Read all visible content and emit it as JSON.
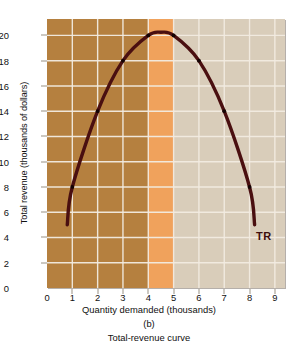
{
  "chart_data": {
    "type": "line",
    "title": "",
    "panel_label": "(b)",
    "caption": "Total-revenue curve",
    "xlabel": "Quantity demanded (thousands)",
    "ylabel": "Total revenue (thousands of dollars)",
    "xlim": [
      0,
      9.4
    ],
    "ylim": [
      0,
      21.3
    ],
    "grid": true,
    "xticks": [
      "0",
      "1",
      "2",
      "3",
      "4",
      "5",
      "6",
      "7",
      "8",
      "9"
    ],
    "xtick_values": [
      0,
      1,
      2,
      3,
      4,
      5,
      6,
      7,
      8,
      9
    ],
    "yticks": [
      "0",
      "2",
      "4",
      "6",
      "8",
      "10",
      "12",
      "14",
      "16",
      "18",
      "$20"
    ],
    "ytick_values": [
      0,
      2,
      4,
      6,
      8,
      10,
      12,
      14,
      16,
      18,
      20
    ],
    "legend": [],
    "series": [
      {
        "name": "TR",
        "label": "TR",
        "label_x": 8.25,
        "label_y": 4.6,
        "color": "#4a0f10",
        "x": [
          0.8,
          1,
          2,
          3,
          4,
          4.5,
          5,
          6,
          7,
          8,
          8.2
        ],
        "y": [
          5.0,
          8.0,
          14.0,
          18.0,
          20.0,
          20.25,
          20.0,
          18.0,
          14.0,
          8.0,
          5.0
        ],
        "markers_x": [
          1,
          2,
          3,
          4,
          5,
          6,
          7,
          8
        ],
        "markers_y": [
          8,
          14,
          18,
          20,
          20,
          18,
          14,
          8
        ]
      }
    ],
    "regions": [
      {
        "name": "elastic-region",
        "from": 0,
        "to": 4,
        "color": "#b5803f"
      },
      {
        "name": "unit-elastic-region",
        "from": 4,
        "to": 5,
        "color": "#f0a25c"
      },
      {
        "name": "inelastic-region",
        "from": 5,
        "to": 9.4,
        "color": "#d9cdba"
      }
    ],
    "gridline_color": "#f3ece2",
    "axis_color": "#9a9183"
  }
}
